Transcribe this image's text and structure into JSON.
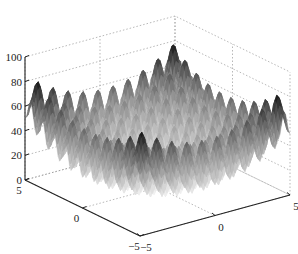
{
  "chart_data": {
    "type": "surface3d",
    "title": "",
    "xlabel": "",
    "ylabel": "",
    "zlabel": "",
    "function_description": "Rastrigin-like multimodal surface: z = 20 + x^2 + y^2 - 10(cos(2πx) + cos(2πy))",
    "x_range": [
      -5,
      5
    ],
    "y_range": [
      -5,
      5
    ],
    "zlim": [
      0,
      100
    ],
    "z_ticks": [
      0,
      20,
      40,
      60,
      80,
      100
    ],
    "z_tick_labels": [
      "0",
      "20",
      "40",
      "60",
      "80",
      "100"
    ],
    "x_ticks": [
      -5,
      0,
      5
    ],
    "x_tick_labels": [
      "−5",
      "0",
      "5"
    ],
    "y_ticks": [
      -5,
      0,
      5
    ],
    "y_tick_labels": [
      "−5",
      "0",
      "5"
    ],
    "grid": true,
    "colormap": "gray (inverted: high = dark)",
    "peak_max_approx": 80,
    "minimum_center_approx": 0
  },
  "colors": {
    "axis": "#222222",
    "grid": "#9a9a9a",
    "surface_high": "#111111",
    "surface_low": "#f4f4f4"
  }
}
